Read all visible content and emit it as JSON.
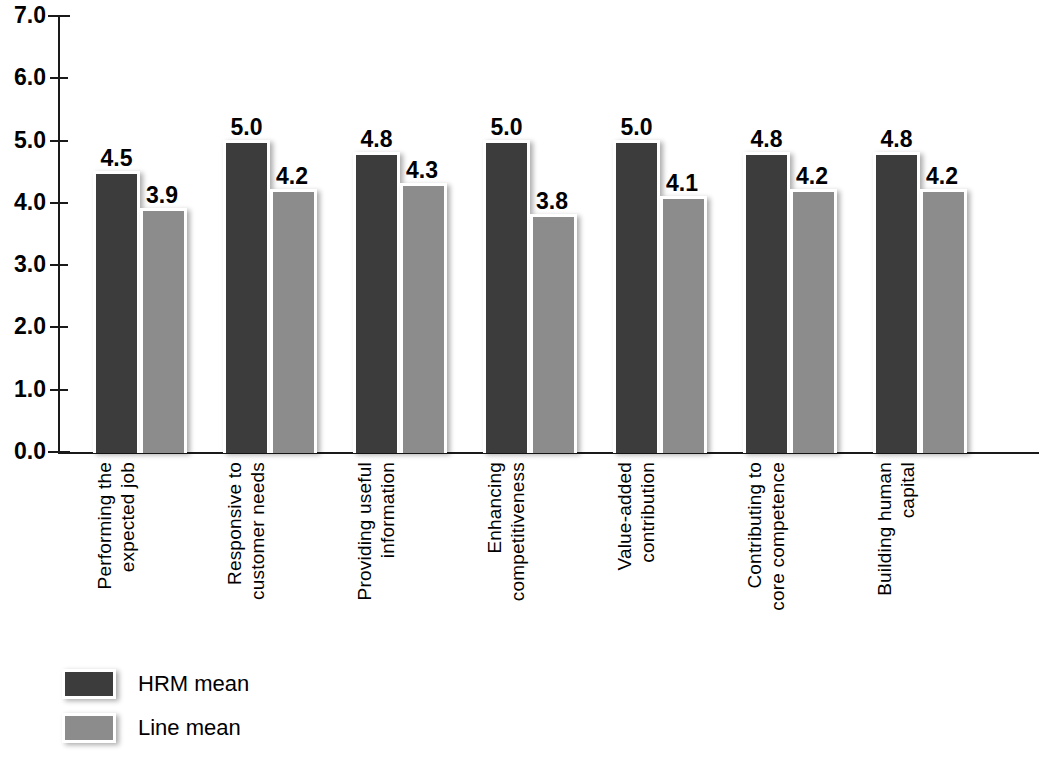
{
  "chart_data": {
    "type": "bar",
    "title": "",
    "subtitle": "",
    "xlabel": "",
    "ylabel": "",
    "ylim": [
      0.0,
      7.0
    ],
    "ytick_step": 1.0,
    "grid": false,
    "legend_position": "bottom-left",
    "ytick_labels": [
      "7.0",
      "6.0",
      "5.0",
      "4.0",
      "3.0",
      "2.0",
      "1.0",
      "0.0"
    ],
    "ytick_values": [
      7.0,
      6.0,
      5.0,
      4.0,
      3.0,
      2.0,
      1.0,
      0.0
    ],
    "categories": [
      "Performing the expected job",
      "Responsive to customer needs",
      "Providing useful information",
      "Enhancing competitiveness",
      "Value-added contribution",
      "Contributing to core competence",
      "Building human capital"
    ],
    "category_lines": [
      [
        "Performing the",
        "expected job"
      ],
      [
        "Responsive to",
        "customer needs"
      ],
      [
        "Providing useful",
        "information"
      ],
      [
        "Enhancing",
        "competitiveness"
      ],
      [
        "Value-added",
        "contribution"
      ],
      [
        "Contributing to",
        "core competence"
      ],
      [
        "Building human",
        "capital"
      ]
    ],
    "series": [
      {
        "name": "HRM mean",
        "color": "#3c3c3c",
        "values": [
          4.5,
          5.0,
          4.8,
          5.0,
          5.0,
          4.8,
          4.8
        ],
        "labels": [
          "4.5",
          "5.0",
          "4.8",
          "5.0",
          "5.0",
          "4.8",
          "4.8"
        ]
      },
      {
        "name": "Line mean",
        "color": "#8c8c8c",
        "values": [
          3.9,
          4.2,
          4.3,
          3.8,
          4.1,
          4.2,
          4.2
        ],
        "labels": [
          "3.9",
          "4.2",
          "4.3",
          "3.8",
          "4.1",
          "4.2",
          "4.2"
        ]
      }
    ]
  },
  "legend": {
    "items": [
      {
        "label": "HRM mean",
        "color": "#3c3c3c"
      },
      {
        "label": "Line mean",
        "color": "#8c8c8c"
      }
    ]
  },
  "colors": {
    "hrm_mean": "#3c3c3c",
    "line_mean": "#8c8c8c",
    "axis": "#1a1a1a",
    "background": "#ffffff",
    "bar_border": "#ffffff"
  }
}
